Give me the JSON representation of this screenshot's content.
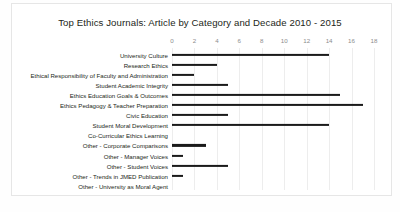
{
  "chart_data": {
    "type": "bar",
    "orientation": "horizontal",
    "title": "Top Ethics Journals: Article by Category and Decade 2010 - 2015",
    "xlabel": "",
    "ylabel": "",
    "xlim": [
      0,
      18
    ],
    "xticks": [
      0,
      2,
      4,
      6,
      8,
      10,
      12,
      14,
      16,
      18
    ],
    "xtick_labels": [
      "0",
      "2",
      "4",
      "6",
      "8",
      "10",
      "12",
      "14",
      "16",
      "18"
    ],
    "grid": "vertical",
    "legend": "none",
    "bar_color": "#1a1a1a",
    "gridline_color": "#ededed",
    "categories": [
      "University Culture",
      "Research Ethics",
      "Ethical Responsibility of Faculty and Administration",
      "Student Academic Integrity",
      "Ethics Education Goals & Outcomes",
      "Ethics Pedagogy & Teacher Preparation",
      "Civic Education",
      "Student Moral Development",
      "Co-Curricular Ethics Learning",
      "Other - Corporate Comparisons",
      "Other - Manager Voices",
      "Other - Student Voices",
      "Other - Trends in JMED Publication",
      "Other - University as Moral Agent"
    ],
    "values": [
      14,
      4,
      2,
      5,
      15,
      17,
      5,
      14,
      0,
      3,
      1,
      5,
      1,
      0
    ]
  }
}
